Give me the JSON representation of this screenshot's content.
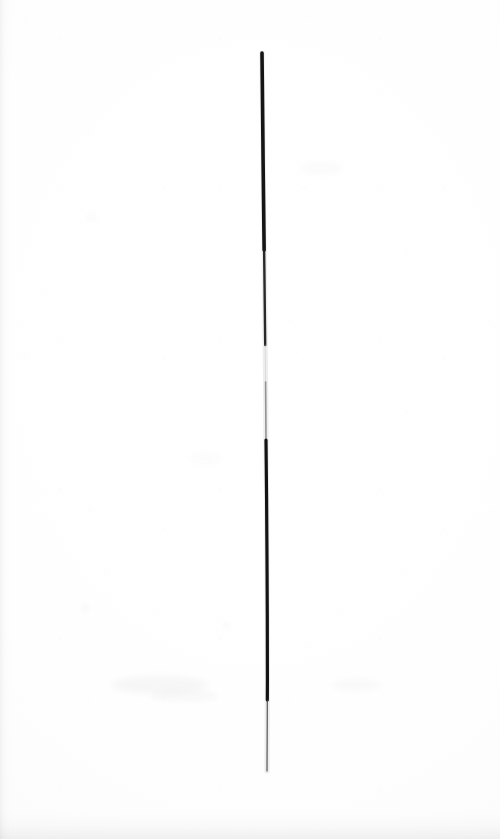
{
  "document": {
    "kind": "scanned-drawing",
    "title": "Single vertical ink line on blank paper",
    "width": 500,
    "height": 839,
    "has_text": false,
    "visible_text": ""
  },
  "colors": {
    "paper": "#fdfdfd",
    "paper_white": "#ffffff",
    "ink_dark": "#151515",
    "ink_mid": "#5a5a5a",
    "ink_faint": "#b9b9b9",
    "edge_shadow": "#e9e9e9"
  },
  "artwork": {
    "name": "vertical-ink-line",
    "description": "A single hand-drawn, nearly vertical line running from near the top of the sheet to the lower third, slightly curved and varying in weight.",
    "start_point": {
      "x": 262,
      "y": 53
    },
    "end_point": {
      "x": 267,
      "y": 771
    },
    "length_px": 718,
    "orientation": "vertical",
    "stroke_color": "#151515",
    "max_width_px": 4,
    "min_width_px": 1,
    "segments": [
      {
        "name": "top-blunt",
        "from_y": 53,
        "to_y": 250,
        "width_px": 3.6,
        "color": "#151515",
        "opacity": 1.0
      },
      {
        "name": "upper-taper",
        "from_y": 250,
        "to_y": 345,
        "width_px": 2.4,
        "color": "#1d1d1d",
        "opacity": 0.95
      },
      {
        "name": "faint-break",
        "from_y": 345,
        "to_y": 382,
        "width_px": 1.0,
        "color": "#c3c3c3",
        "opacity": 0.45
      },
      {
        "name": "recovery",
        "from_y": 382,
        "to_y": 440,
        "width_px": 1.6,
        "color": "#6e6e6e",
        "opacity": 0.7
      },
      {
        "name": "lower-dark",
        "from_y": 440,
        "to_y": 700,
        "width_px": 3.2,
        "color": "#131313",
        "opacity": 1.0
      },
      {
        "name": "bottom-taper",
        "from_y": 700,
        "to_y": 771,
        "width_px": 1.2,
        "color": "#3a3a3a",
        "opacity": 0.85
      }
    ],
    "path_points": [
      {
        "x": 262.0,
        "y": 53
      },
      {
        "x": 262.6,
        "y": 110
      },
      {
        "x": 263.2,
        "y": 170
      },
      {
        "x": 263.9,
        "y": 230
      },
      {
        "x": 264.6,
        "y": 290
      },
      {
        "x": 265.2,
        "y": 345
      },
      {
        "x": 265.6,
        "y": 382
      },
      {
        "x": 266.0,
        "y": 440
      },
      {
        "x": 266.6,
        "y": 500
      },
      {
        "x": 267.0,
        "y": 560
      },
      {
        "x": 267.3,
        "y": 620
      },
      {
        "x": 267.4,
        "y": 680
      },
      {
        "x": 267.2,
        "y": 730
      },
      {
        "x": 267.0,
        "y": 771
      }
    ]
  },
  "scan_artifacts": {
    "left_edge_band": "faint grey strip along left margin",
    "bottom_edge_band": "faint grey band along bottom edge",
    "smudges": "very faint grey smudges in the lower-left and lower-middle areas"
  }
}
